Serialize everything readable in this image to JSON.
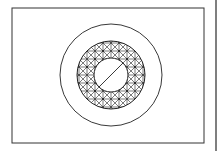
{
  "diagram": {
    "title": "",
    "frame": {
      "x": 12,
      "y": 8,
      "width": 192,
      "height": 135
    },
    "center": {
      "x": 111,
      "y": 75
    },
    "outer_circle_radius": 51,
    "mesh_outer_radius": 34,
    "mesh_inner_radius": 17,
    "mesh_grid_step": 8,
    "stroke_color": "#222222",
    "background": "#ffffff"
  }
}
